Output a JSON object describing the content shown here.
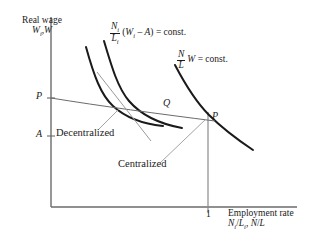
{
  "figure": {
    "type": "economic-diagram",
    "background": "#ffffff",
    "ink": "#1a1a1a",
    "width": 316,
    "height": 250
  },
  "axes": {
    "y_title_line1": "Real wage",
    "y_title_line2_pre": "W",
    "y_title_line2_sub": "i",
    "y_title_line2_post": ",W",
    "x_title_line1": "Employment rate",
    "x_title_line2_a": "N",
    "x_title_line2_a_sub": "i",
    "x_title_line2_slash1": "/",
    "x_title_line2_b": "L",
    "x_title_line2_b_sub": "i",
    "x_title_line2_sep": ", ",
    "x_title_line2_c": "N",
    "x_title_line2_slash2": "/",
    "x_title_line2_d": "L",
    "x_tick_value": "1",
    "origin_x": 51,
    "origin_y": 207,
    "x_tick_position": 208
  },
  "curves": {
    "decentralized_iso": {
      "label_formula_frac_num": "N",
      "label_formula_frac_num_sub": "i",
      "label_formula_frac_den": "L",
      "label_formula_frac_den_sub": "i",
      "label_formula_rest_pre": "(",
      "label_formula_W": "W",
      "label_formula_W_sub": "i",
      "label_formula_minus": " – ",
      "label_formula_A": "A",
      "label_formula_rest_post": ") = const."
    },
    "centralized_iso": {
      "label_formula_frac_num": "N",
      "label_formula_frac_den": "L",
      "label_formula_W": "W",
      "label_formula_rest": " = const."
    }
  },
  "annotations": {
    "decentralized": "Decentralized",
    "centralized": "Centralized",
    "point_P_axis": "P",
    "point_P_right": "P",
    "point_Q": "Q",
    "point_A_axis": "A"
  }
}
